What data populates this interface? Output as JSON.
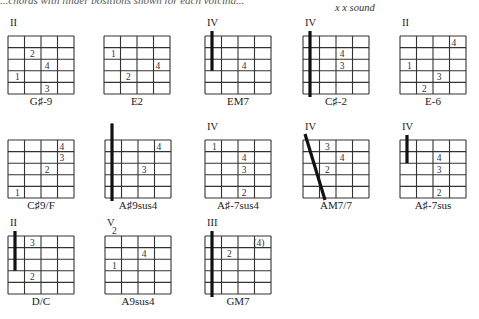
{
  "header": {
    "cutoff_line": "...chords with finger positions shown for each voicing...",
    "subtitle": "x x sound"
  },
  "chords": [
    {
      "name": "G♯-9",
      "position": "II",
      "barre": null,
      "fingers": [
        {
          "f": "2",
          "string": 2,
          "fret": 2
        },
        {
          "f": "4",
          "string": 3,
          "fret": 3
        },
        {
          "f": "1",
          "string": 1,
          "fret": 4
        },
        {
          "f": "3",
          "string": 3,
          "fret": 5
        }
      ]
    },
    {
      "name": "E2",
      "position": "",
      "barre": null,
      "fingers": [
        {
          "f": "1",
          "string": 1,
          "fret": 2
        },
        {
          "f": "4",
          "string": 4,
          "fret": 3
        },
        {
          "f": "2",
          "string": 2,
          "fret": 4
        }
      ]
    },
    {
      "name": "EM7",
      "position": "IV",
      "barre": {
        "type": "partial",
        "from": 0,
        "to": 3
      },
      "fingers": [
        {
          "f": "4",
          "string": 3,
          "fret": 3
        }
      ]
    },
    {
      "name": "C♯-2",
      "position": "IV",
      "barre": {
        "type": "full",
        "from": 0,
        "to": 5
      },
      "fingers": [
        {
          "f": "4",
          "string": 3,
          "fret": 2
        },
        {
          "f": "3",
          "string": 3,
          "fret": 3
        }
      ]
    },
    {
      "name": "E-6",
      "position": "II",
      "barre": null,
      "fingers": [
        {
          "f": "4",
          "string": 4,
          "fret": 1
        },
        {
          "f": "1",
          "string": 1,
          "fret": 3
        },
        {
          "f": "3",
          "string": 3,
          "fret": 4
        },
        {
          "f": "2",
          "string": 2,
          "fret": 5
        }
      ]
    },
    {
      "name": "C♯9/F",
      "position": "",
      "barre": null,
      "fingers": [
        {
          "f": "4",
          "string": 4,
          "fret": 1
        },
        {
          "f": "3",
          "string": 4,
          "fret": 2
        },
        {
          "f": "2",
          "string": 3,
          "fret": 3
        },
        {
          "f": "1",
          "string": 1,
          "fret": 5
        }
      ]
    },
    {
      "name": "A♯9sus4",
      "position": "",
      "barre": {
        "type": "full",
        "from": -1,
        "to": 5
      },
      "fingers": [
        {
          "f": "4",
          "string": 4,
          "fret": 1
        },
        {
          "f": "3",
          "string": 3,
          "fret": 3
        }
      ]
    },
    {
      "name": "A♯-7sus4",
      "position": "IV",
      "barre": null,
      "fingers": [
        {
          "f": "1",
          "string": 1,
          "fret": 1
        },
        {
          "f": "4",
          "string": 3,
          "fret": 2
        },
        {
          "f": "3",
          "string": 3,
          "fret": 3
        },
        {
          "f": "2",
          "string": 3,
          "fret": 5
        }
      ]
    },
    {
      "name": "AM7/7",
      "position": "IV",
      "barre": {
        "type": "diagonal",
        "from": 0,
        "to": 5
      },
      "fingers": [
        {
          "f": "3",
          "string": 2,
          "fret": 1
        },
        {
          "f": "4",
          "string": 3,
          "fret": 2
        },
        {
          "f": "2",
          "string": 2,
          "fret": 3
        }
      ]
    },
    {
      "name": "A♯-7sus",
      "position": "IV",
      "barre": {
        "type": "partial",
        "from": 0,
        "to": 2
      },
      "fingers": [
        {
          "f": "4",
          "string": 3,
          "fret": 2
        },
        {
          "f": "3",
          "string": 3,
          "fret": 3
        },
        {
          "f": "2",
          "string": 3,
          "fret": 5
        }
      ]
    },
    {
      "name": "D/C",
      "position": "II",
      "barre": {
        "type": "partial",
        "from": 0,
        "to": 3
      },
      "fingers": [
        {
          "f": "3",
          "string": 2,
          "fret": 1
        },
        {
          "f": "2",
          "string": 2,
          "fret": 4
        }
      ]
    },
    {
      "name": "A9sus4",
      "position": "V",
      "barre": null,
      "fingers": [
        {
          "f": "2",
          "string": 1,
          "fret": 0
        },
        {
          "f": "4",
          "string": 3,
          "fret": 2
        },
        {
          "f": "1",
          "string": 1,
          "fret": 3
        }
      ]
    },
    {
      "name": "GM7",
      "position": "III",
      "barre": {
        "type": "full",
        "from": 0,
        "to": 5
      },
      "fingers": [
        {
          "f": "(4)",
          "string": 4,
          "fret": 1
        },
        {
          "f": "2",
          "string": 2,
          "fret": 2
        }
      ]
    }
  ]
}
